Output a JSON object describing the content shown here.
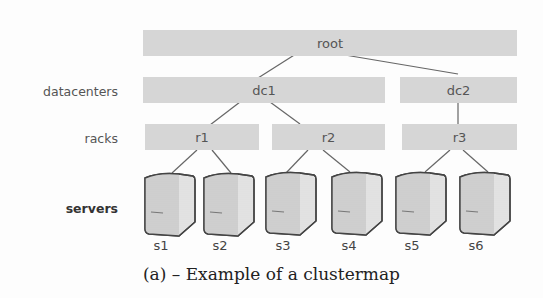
{
  "levels": {
    "datacenters": "datacenters",
    "racks": "racks",
    "servers": "servers"
  },
  "nodes": {
    "root": "root",
    "dc1": "dc1",
    "dc2": "dc2",
    "r1": "r1",
    "r2": "r2",
    "r3": "r3"
  },
  "servers": [
    "s1",
    "s2",
    "s3",
    "s4",
    "s5",
    "s6"
  ],
  "caption": "(a) – Example of a clustermap"
}
